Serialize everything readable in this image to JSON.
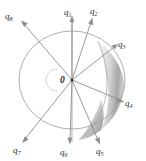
{
  "figure": {
    "origin_label": "0",
    "background_color": "#ffffff",
    "line_color": "#8d8d8d",
    "label_color": "#2b2b2b",
    "shade_color": "#b8b8b8",
    "circle": {
      "center_x": 72,
      "center_y": 80,
      "radius_x": 53,
      "radius_y": 49
    },
    "shaded_region": {
      "name": "crescent-lens-shading",
      "fill_light": "#f0f0f0",
      "fill_dark": "#9a9a9a"
    },
    "vectors": [
      {
        "id": "q1",
        "symbol": "q",
        "subscript": "1",
        "label": "q₁",
        "angle_deg": 90,
        "label_x": 68,
        "label_y": 12,
        "tip_x": 72,
        "tip_y": 16
      },
      {
        "id": "q2",
        "symbol": "q",
        "subscript": "2",
        "label": "q₂",
        "angle_deg": 62,
        "label_x": 94,
        "label_y": 12,
        "tip_x": 92,
        "tip_y": 18
      },
      {
        "id": "q3",
        "symbol": "q",
        "subscript": "3",
        "label": "q₃",
        "angle_deg": 33,
        "label_x": 121,
        "label_y": 45,
        "tip_x": 117,
        "tip_y": 45
      },
      {
        "id": "q4",
        "symbol": "q",
        "subscript": "4",
        "label": "q₄",
        "angle_deg": -14,
        "label_x": 128,
        "label_y": 104,
        "tip_x": 123,
        "tip_y": 102
      },
      {
        "id": "q5",
        "symbol": "q",
        "subscript": "5",
        "label": "q₅",
        "angle_deg": -57,
        "label_x": 99,
        "label_y": 152,
        "tip_x": 100,
        "tip_y": 143
      },
      {
        "id": "q6",
        "symbol": "q",
        "subscript": "6",
        "label": "q₆",
        "angle_deg": -90,
        "label_x": 63,
        "label_y": 153,
        "tip_x": 69,
        "tip_y": 143
      },
      {
        "id": "q7",
        "symbol": "q",
        "subscript": "7",
        "label": "q₇",
        "angle_deg": -132,
        "label_x": 16,
        "label_y": 152,
        "tip_x": 23,
        "tip_y": 142
      },
      {
        "id": "q8",
        "symbol": "q",
        "subscript": "8",
        "label": "q₈",
        "angle_deg": 137,
        "label_x": 7,
        "label_y": 17,
        "tip_x": 21,
        "tip_y": 22
      }
    ]
  }
}
